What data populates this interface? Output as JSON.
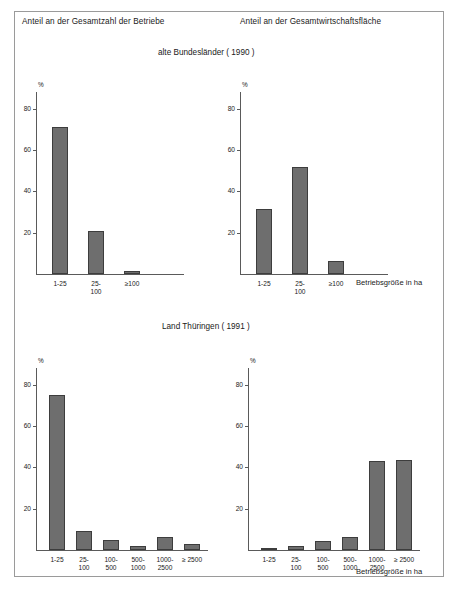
{
  "figure": {
    "headers": {
      "left": "Anteil an der Gesamtzahl der Betriebe",
      "right": "Anteil an der Gesamtwirtschaftsfläche"
    },
    "section_titles": {
      "top": "alte Bundesländer  ( 1990 )",
      "bottom": "Land Thüringen ( 1991 )"
    },
    "axis_caption": "Betriebsgröße in ha",
    "percent_symbol": "%",
    "colors": {
      "bar_fill": "#6e6e6e",
      "bar_stroke": "#3d3d3d",
      "axis": "#5a5a5a",
      "frame": "#9a9a9a",
      "text": "#1a1a1a",
      "background": "#ffffff"
    }
  },
  "chart_data": [
    {
      "id": "top-left",
      "type": "bar",
      "title": "alte Bundesländer  ( 1990 ) — Anteil an der Gesamtzahl der Betriebe",
      "categories": [
        "1-25",
        "25-\n100",
        "≥100"
      ],
      "values": [
        71,
        21,
        1.5
      ],
      "xlabel": "Betriebsgröße in ha",
      "ylabel": "%",
      "ylim": [
        0,
        88
      ],
      "yticks": [
        20,
        40,
        60,
        80
      ],
      "ytick_labels": [
        "20",
        "40",
        "60",
        "80"
      ],
      "grid": false,
      "legend": "none"
    },
    {
      "id": "top-right",
      "type": "bar",
      "title": "alte Bundesländer  ( 1990 ) — Anteil an der Gesamtwirtschaftsfläche",
      "categories": [
        "1-25",
        "25-\n100",
        "≥100"
      ],
      "values": [
        31.5,
        51.5,
        6.5
      ],
      "xlabel": "Betriebsgröße in ha",
      "ylabel": "%",
      "ylim": [
        0,
        88
      ],
      "yticks": [
        20,
        40,
        60,
        80
      ],
      "ytick_labels": [
        "20",
        "40",
        "60",
        "80"
      ],
      "grid": false,
      "legend": "none"
    },
    {
      "id": "bottom-left",
      "type": "bar",
      "title": "Land Thüringen ( 1991 ) — Anteil an der Gesamtzahl der Betriebe",
      "categories": [
        "1-25",
        "25-\n100",
        "100-\n500",
        "500-\n1000",
        "1000-\n2500",
        "≥ 2500"
      ],
      "values": [
        75,
        9,
        5,
        2,
        6.5,
        3
      ],
      "xlabel": "Betriebsgröße in ha",
      "ylabel": "%",
      "ylim": [
        0,
        88
      ],
      "yticks": [
        20,
        40,
        60,
        80
      ],
      "ytick_labels": [
        "20",
        "40",
        "60",
        "80"
      ],
      "grid": false,
      "legend": "none"
    },
    {
      "id": "bottom-right",
      "type": "bar",
      "title": "Land Thüringen ( 1991 ) — Anteil an der Gesamtwirtschaftsfläche",
      "categories": [
        "1-25",
        "25-\n100",
        "100-\n500",
        "500-\n1000",
        "1000-\n2500",
        "≥ 2500"
      ],
      "values": [
        1,
        2,
        4.5,
        6.5,
        43,
        43.5
      ],
      "xlabel": "Betriebsgröße in ha",
      "ylabel": "%",
      "ylim": [
        0,
        88
      ],
      "yticks": [
        20,
        40,
        60,
        80
      ],
      "ytick_labels": [
        "20",
        "40",
        "60",
        "80"
      ],
      "grid": false,
      "legend": "none"
    }
  ]
}
